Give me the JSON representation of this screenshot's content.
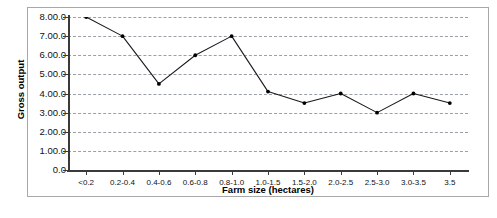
{
  "chart_data": {
    "type": "line",
    "title": "",
    "xlabel": "Farm size (hectares)",
    "ylabel": "Gross output",
    "categories": [
      "<0.2",
      "0.2-0.4",
      "0.4-0.6",
      "0.6-0.8",
      "0.8-1.0",
      "1.0-1.5",
      "1.5-2.0",
      "2.0-2.5",
      "2.5-3.0",
      "3.0-3.5",
      "3.5"
    ],
    "values": [
      8.0,
      7.0,
      4.5,
      6.0,
      7.0,
      4.1,
      3.5,
      4.0,
      3.0,
      4.0,
      3.5
    ],
    "ylim": [
      0,
      8
    ],
    "ytick_values": [
      0,
      1,
      2,
      3,
      4,
      5,
      6,
      7,
      8
    ],
    "ytick_labels": [
      "0.0",
      "1.00.0",
      "2.00.0",
      "3.00.0",
      "4.00.0",
      "5.00.0",
      "6.00.0",
      "7.00.0",
      "8.00.0"
    ],
    "grid": true,
    "grid_axis": "y",
    "legend": false,
    "legend_position": "none",
    "marker": "filled-circle",
    "line_color": "#1a1a1a",
    "marker_color": "#000000",
    "grid_color": "#9aa0a6",
    "axis_color": "#3a3a3a",
    "background_color": "#ffffff",
    "border_color": "#a8a8a8"
  }
}
